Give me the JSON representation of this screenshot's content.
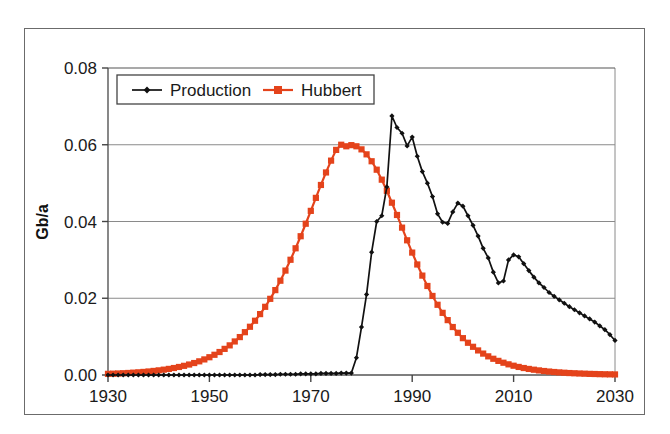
{
  "chart_data": {
    "type": "line",
    "title": "",
    "xlabel": "",
    "ylabel": "Gb/a",
    "xlim": [
      1930,
      2030
    ],
    "ylim": [
      0.0,
      0.08
    ],
    "grid": "horizontal",
    "legend_position": "top-left-inside",
    "xticks": [
      "1930",
      "1950",
      "1970",
      "1990",
      "2010",
      "2030"
    ],
    "xtick_values": [
      1930,
      1950,
      1970,
      1990,
      2010,
      2030
    ],
    "yticks": [
      "0.00",
      "0.02",
      "0.04",
      "0.06",
      "0.08"
    ],
    "ytick_values": [
      0.0,
      0.02,
      0.04,
      0.06,
      0.08
    ],
    "series": [
      {
        "name": "Production",
        "color": "#111111",
        "marker": "diamond",
        "x": [
          1930,
          1931,
          1932,
          1933,
          1934,
          1935,
          1936,
          1937,
          1938,
          1939,
          1940,
          1941,
          1942,
          1943,
          1944,
          1945,
          1946,
          1947,
          1948,
          1949,
          1950,
          1951,
          1952,
          1953,
          1954,
          1955,
          1956,
          1957,
          1958,
          1959,
          1960,
          1961,
          1962,
          1963,
          1964,
          1965,
          1966,
          1967,
          1968,
          1969,
          1970,
          1971,
          1972,
          1973,
          1974,
          1975,
          1976,
          1977,
          1978,
          1979,
          1980,
          1981,
          1982,
          1983,
          1984,
          1985,
          1986,
          1987,
          1988,
          1989,
          1990,
          1991,
          1992,
          1993,
          1994,
          1995,
          1996,
          1997,
          1998,
          1999,
          2000,
          2001,
          2002,
          2003,
          2004,
          2005,
          2006,
          2007,
          2008,
          2009,
          2010,
          2011,
          2012,
          2013,
          2014,
          2015,
          2016,
          2017,
          2018,
          2019,
          2020,
          2021,
          2022,
          2023,
          2024,
          2025,
          2026,
          2027,
          2028,
          2029,
          2030
        ],
        "values": [
          0.0,
          0.0,
          0.0,
          0.0,
          0.0,
          0.0,
          0.0,
          0.0,
          0.0,
          0.0,
          0.0,
          0.0,
          0.0,
          0.0,
          0.0,
          0.0,
          0.0,
          0.0,
          0.0,
          0.0,
          0.0,
          0.0,
          0.0,
          0.0,
          0.0,
          0.0,
          0.0,
          0.0,
          0.0,
          0.0,
          0.0001,
          0.0001,
          0.0001,
          0.0001,
          0.0002,
          0.0002,
          0.0002,
          0.0002,
          0.0003,
          0.0003,
          0.0003,
          0.0003,
          0.0004,
          0.0004,
          0.0004,
          0.0004,
          0.0005,
          0.0005,
          0.0005,
          0.0045,
          0.0125,
          0.021,
          0.032,
          0.04,
          0.0415,
          0.049,
          0.0675,
          0.0645,
          0.063,
          0.0597,
          0.062,
          0.057,
          0.053,
          0.05,
          0.0465,
          0.042,
          0.0398,
          0.0395,
          0.0425,
          0.0448,
          0.044,
          0.0415,
          0.039,
          0.0362,
          0.033,
          0.0305,
          0.0268,
          0.024,
          0.0245,
          0.03,
          0.0313,
          0.0308,
          0.029,
          0.0272,
          0.0255,
          0.024,
          0.0228,
          0.0215,
          0.0205,
          0.0196,
          0.0187,
          0.0178,
          0.017,
          0.0162,
          0.0154,
          0.0146,
          0.0138,
          0.0128,
          0.0118,
          0.0105,
          0.009
        ]
      },
      {
        "name": "Hubbert",
        "color": "#E4431B",
        "marker": "square",
        "x": [
          1930,
          1931,
          1932,
          1933,
          1934,
          1935,
          1936,
          1937,
          1938,
          1939,
          1940,
          1941,
          1942,
          1943,
          1944,
          1945,
          1946,
          1947,
          1948,
          1949,
          1950,
          1951,
          1952,
          1953,
          1954,
          1955,
          1956,
          1957,
          1958,
          1959,
          1960,
          1961,
          1962,
          1963,
          1964,
          1965,
          1966,
          1967,
          1968,
          1969,
          1970,
          1971,
          1972,
          1973,
          1974,
          1975,
          1976,
          1977,
          1978,
          1979,
          1980,
          1981,
          1982,
          1983,
          1984,
          1985,
          1986,
          1987,
          1988,
          1989,
          1990,
          1991,
          1992,
          1993,
          1994,
          1995,
          1996,
          1997,
          1998,
          1999,
          2000,
          2001,
          2002,
          2003,
          2004,
          2005,
          2006,
          2007,
          2008,
          2009,
          2010,
          2011,
          2012,
          2013,
          2014,
          2015,
          2016,
          2017,
          2018,
          2019,
          2020,
          2021,
          2022,
          2023,
          2024,
          2025,
          2026,
          2027,
          2028,
          2029,
          2030
        ],
        "values": [
          0.0003,
          0.00035,
          0.0004,
          0.00046,
          0.00053,
          0.00061,
          0.0007,
          0.0008,
          0.00092,
          0.00106,
          0.00121,
          0.00139,
          0.00159,
          0.00182,
          0.00209,
          0.00239,
          0.00273,
          0.00312,
          0.00356,
          0.00406,
          0.00463,
          0.00527,
          0.00599,
          0.00681,
          0.00772,
          0.00874,
          0.00988,
          0.01116,
          0.01257,
          0.01414,
          0.01587,
          0.01777,
          0.01985,
          0.02212,
          0.02457,
          0.02721,
          0.03003,
          0.03302,
          0.03616,
          0.03942,
          0.04277,
          0.04616,
          0.04952,
          0.05278,
          0.05586,
          0.05866,
          0.06,
          0.0596,
          0.0599,
          0.0596,
          0.0588,
          0.0575,
          0.0557,
          0.0535,
          0.0509,
          0.048,
          0.0449,
          0.0417,
          0.0384,
          0.0351,
          0.0319,
          0.0288,
          0.0259,
          0.0232,
          0.0206,
          0.0183,
          0.0162,
          0.0143,
          0.0125,
          0.011,
          0.0096,
          0.0084,
          0.00735,
          0.0064,
          0.00558,
          0.00486,
          0.00423,
          0.00368,
          0.0032,
          0.00278,
          0.00242,
          0.0021,
          0.00182,
          0.00158,
          0.00138,
          0.0012,
          0.00104,
          0.0009,
          0.00078,
          0.00068,
          0.00059,
          0.00051,
          0.00045,
          0.00039,
          0.00034,
          0.00029,
          0.00026,
          0.00022,
          0.00019,
          0.00017,
          0.00015
        ]
      }
    ]
  },
  "legend": {
    "entries": [
      {
        "label": "Production",
        "color": "#111111",
        "marker": "diamond"
      },
      {
        "label": "Hubbert",
        "color": "#E4431B",
        "marker": "square"
      }
    ]
  },
  "axes": {
    "y_title": "Gb/a"
  }
}
